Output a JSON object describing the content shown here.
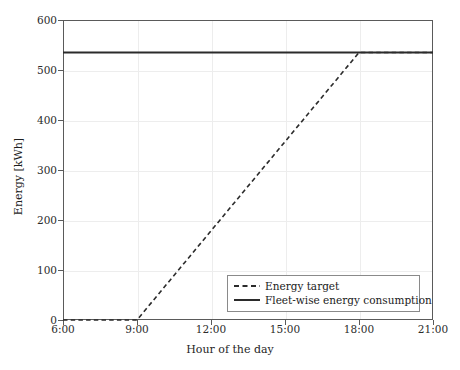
{
  "chart_data": {
    "type": "line",
    "title": "",
    "xlabel": "Hour of the day",
    "ylabel": "Energy [kWh]",
    "xlim": [
      6,
      21
    ],
    "ylim": [
      0,
      600
    ],
    "xticks": [
      6,
      9,
      12,
      15,
      18,
      21
    ],
    "xtick_labels": [
      "6:00",
      "9:00",
      "12:00",
      "15:00",
      "18:00",
      "21:00"
    ],
    "yticks": [
      0,
      100,
      200,
      300,
      400,
      500,
      600
    ],
    "ytick_labels": [
      "0",
      "100",
      "200",
      "300",
      "400",
      "500",
      "600"
    ],
    "grid": true,
    "legend_position": "lower right",
    "series": [
      {
        "name": "Energy target",
        "style": "dashed",
        "color": "#2b2b2b",
        "x": [
          6,
          9,
          18,
          21
        ],
        "y": [
          0,
          0,
          535,
          535
        ]
      },
      {
        "name": "Fleet-wise energy consumption",
        "style": "solid",
        "color": "#2b2b2b",
        "x": [
          6,
          21
        ],
        "y": [
          535,
          535
        ]
      }
    ]
  },
  "axes": {
    "x_label": "Hour of the day",
    "y_label": "Energy [kWh]"
  },
  "legend": {
    "entries": [
      {
        "label": "Energy target",
        "style": "dashed"
      },
      {
        "label": "Fleet-wise energy consumption",
        "style": "solid"
      }
    ]
  },
  "colors": {
    "line": "#2b2b2b",
    "grid": "#ededed",
    "frame": "#5a5a5a",
    "background": "#ffffff"
  }
}
